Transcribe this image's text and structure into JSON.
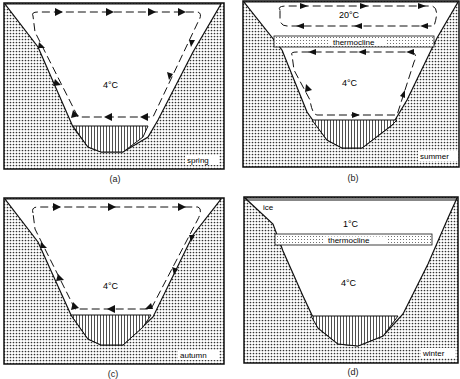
{
  "panels": [
    {
      "id": "a",
      "caption": "(a)",
      "season": "spring",
      "temps": [
        "4°C"
      ]
    },
    {
      "id": "b",
      "caption": "(b)",
      "season": "summer",
      "temps": [
        "20°C",
        "4°C"
      ],
      "layer": "thermocline"
    },
    {
      "id": "c",
      "caption": "(c)",
      "season": "autumn",
      "temps": [
        "4°C"
      ]
    },
    {
      "id": "d",
      "caption": "(d)",
      "season": "winter",
      "temps": [
        "1°C",
        "4°C"
      ],
      "layer": "thermocline",
      "surface": "ice"
    }
  ],
  "colors": {
    "stroke": "#1a1a1a",
    "ground_dot": "#333333",
    "background": "#ffffff"
  }
}
